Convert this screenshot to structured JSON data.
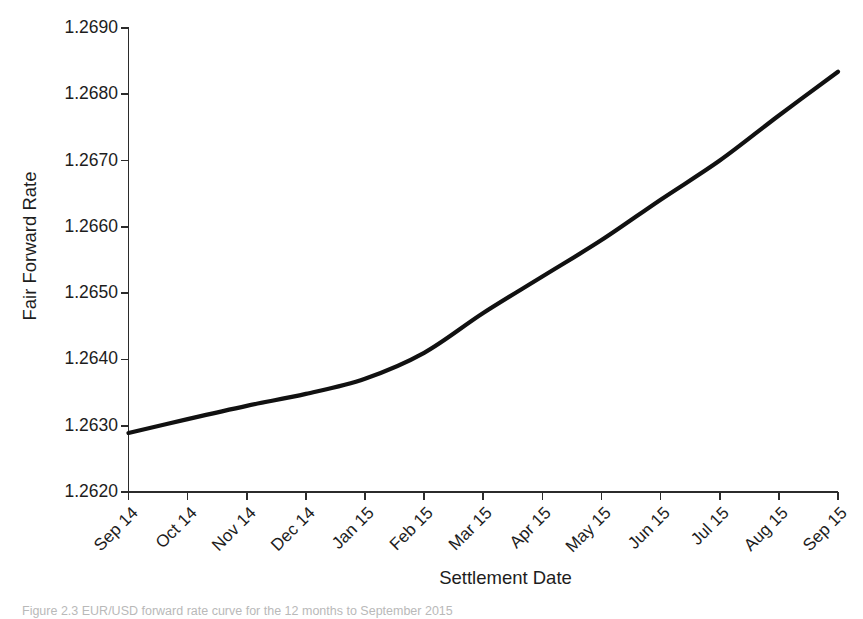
{
  "chart_data": {
    "type": "line",
    "title": "",
    "xlabel": "Settlement Date",
    "ylabel": "Fair Forward Rate",
    "categories": [
      "Sep 14",
      "Oct 14",
      "Nov 14",
      "Dec 14",
      "Jan 15",
      "Feb 15",
      "Mar 15",
      "Apr 15",
      "May 15",
      "Jun 15",
      "Jul 15",
      "Aug 15",
      "Sep 15"
    ],
    "x_tick_labels": [
      "Sep 14",
      "Oct 14",
      "Nov 14",
      "Dec 14",
      "Jan 15",
      "Feb 15",
      "Mar 15",
      "Apr 15",
      "May 15",
      "Jun 15",
      "Jul 15",
      "Aug 15",
      "Sep 15"
    ],
    "y_tick_labels": [
      "1.2690",
      "1.2680",
      "1.2670",
      "1.2660",
      "1.2650",
      "1.2640",
      "1.2630",
      "1.2620"
    ],
    "y_ticks": [
      1.269,
      1.268,
      1.267,
      1.266,
      1.265,
      1.264,
      1.263,
      1.262
    ],
    "ylim": [
      1.262,
      1.269
    ],
    "xlim": [
      0,
      12
    ],
    "grid": false,
    "legend": false,
    "legend_position": "none",
    "series": [
      {
        "name": "Fair Forward Rate",
        "color": "#111111",
        "x": [
          "Sep 14",
          "Oct 14",
          "Nov 14",
          "Dec 14",
          "Jan 15",
          "Feb 15",
          "Mar 15",
          "Apr 15",
          "May 15",
          "Jun 15",
          "Jul 15",
          "Aug 15",
          "Sep 15"
        ],
        "values": [
          1.26289,
          1.2631,
          1.2633,
          1.26348,
          1.26371,
          1.2641,
          1.2647,
          1.26525,
          1.2658,
          1.26641,
          1.267,
          1.26768,
          1.26834
        ]
      }
    ],
    "line_color": "#111111",
    "line_width": 4.2,
    "background": "#ffffff",
    "axes_color": "#2b2b2b"
  },
  "caption": {
    "text": "Figure 2.3  EUR/USD forward rate curve for the 12 months to September 2015"
  }
}
